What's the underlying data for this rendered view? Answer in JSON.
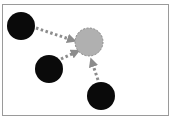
{
  "diagram": {
    "colors": {
      "source_fill": "#0a0a0a",
      "target_fill": "#b0b0b0",
      "target_stroke": "#8a8a8a",
      "arrow": "#8c8c8c",
      "frame": "#9a9a9a"
    },
    "target": {
      "label": "target-node",
      "cx": 89,
      "cy": 42,
      "r": 14
    },
    "sources": [
      {
        "label": "source-node-1",
        "cx": 21,
        "cy": 26,
        "r": 14
      },
      {
        "label": "source-node-2",
        "cx": 49,
        "cy": 69,
        "r": 14
      },
      {
        "label": "source-node-3",
        "cx": 101,
        "cy": 96,
        "r": 14
      }
    ]
  }
}
